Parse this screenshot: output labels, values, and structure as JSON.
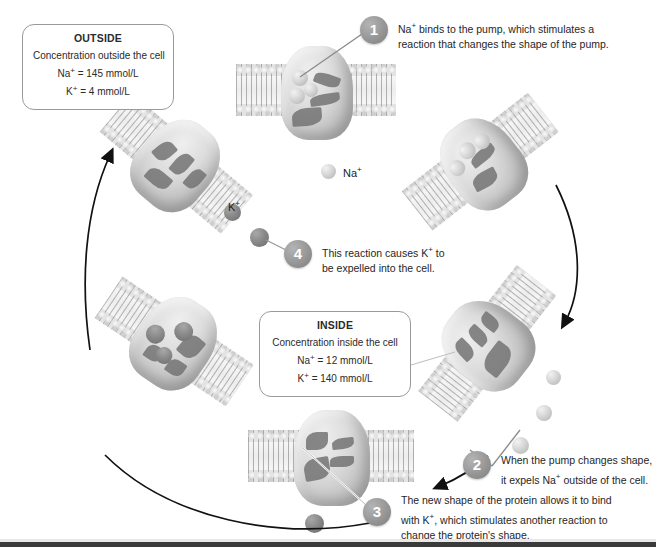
{
  "diagram": {
    "background_color": "#ffffff",
    "ion_na_color": "#d6d6d6",
    "ion_k_color": "#8a8a8a",
    "step_circle_color": "#9a9a9a"
  },
  "boxes": {
    "outside": {
      "title": "OUTSIDE",
      "subtitle": "Concentration outside the cell",
      "line_na": "Na+ = 145 mmol/L",
      "line_k": "K+ = 4 mmol/L",
      "na_label": "Na",
      "na_sup": "+",
      "na_value": "= 145 mmol/L",
      "k_label": "K",
      "k_sup": "+",
      "k_value": "= 4 mmol/L"
    },
    "inside": {
      "title": "INSIDE",
      "subtitle": "Concentration inside the cell",
      "line_na": "Na+ = 12 mmol/L",
      "line_k": "K+ = 140 mmol/L",
      "na_label": "Na",
      "na_sup": "+",
      "na_value": "= 12 mmol/L",
      "k_label": "K",
      "k_sup": "+",
      "k_value": "= 140 mmol/L"
    }
  },
  "steps": [
    {
      "number": "1",
      "line1_a": "Na",
      "line1_sup": "+",
      "line1_b": " binds to the pump, which stimulates a",
      "line2": "reaction that changes the shape of the pump.",
      "full_text": "Na+ binds to the pump, which stimulates a reaction that changes the shape of the pump."
    },
    {
      "number": "2",
      "line1": "When the pump changes shape,",
      "line2_a": "it expels Na",
      "line2_sup": "+",
      "line2_b": " outside of the cell.",
      "full_text": "When the pump changes shape, it expels Na+ outside of the cell."
    },
    {
      "number": "3",
      "line1": "The new shape of the protein allows it to bind",
      "line2_a": "with K",
      "line2_sup": "+",
      "line2_b": ", which stimulates another reaction to",
      "line3": "change the protein's shape.",
      "full_text": "The new shape of the protein allows it to bind with K+, which stimulates another reaction to change the protein's shape."
    },
    {
      "number": "4",
      "line1_a": "This reaction causes K",
      "line1_sup": "+",
      "line1_b": " to",
      "line2": "be expelled into the cell.",
      "full_text": "This reaction causes K+ to be expelled into the cell."
    }
  ],
  "legend": {
    "sodium": {
      "label": "Na",
      "sup": "+",
      "full": "Na+",
      "color": "#d6d6d6"
    },
    "potassium": {
      "label": "K",
      "sup": "+",
      "full": "K+",
      "color": "#8a8a8a"
    }
  }
}
